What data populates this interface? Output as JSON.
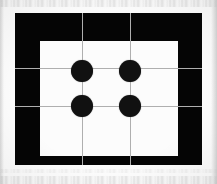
{
  "image": {
    "title": "Calibration target scan",
    "description": "Scanned black rectangular calibration frame with white inner panel, four black circular fiducial dots in a 2x2 arrangement, and a light gray 3x3 grid overlay",
    "width": 217,
    "height": 184,
    "background_color": "#fdfdfd"
  },
  "frame": {
    "name": "black-frame",
    "color": "#050505",
    "x": 15,
    "y": 13,
    "width": 187,
    "height": 152
  },
  "panel": {
    "name": "white-panel",
    "color": "#fcfcfc",
    "x": 25,
    "y": 28,
    "width": 138,
    "height": 115
  },
  "grid": {
    "color": "#afafaf",
    "columns": 3,
    "rows": 3,
    "vertical_lines": [
      82,
      130
    ],
    "horizontal_lines": [
      68,
      106
    ]
  },
  "dots": {
    "count": 4,
    "color": "#111111",
    "radius": 11,
    "items": [
      {
        "label": "dot-top-left",
        "cx": 82,
        "cy": 71
      },
      {
        "label": "dot-top-right",
        "cx": 130,
        "cy": 71
      },
      {
        "label": "dot-bottom-left",
        "cx": 82,
        "cy": 106
      },
      {
        "label": "dot-bottom-right",
        "cx": 130,
        "cy": 106
      }
    ]
  }
}
